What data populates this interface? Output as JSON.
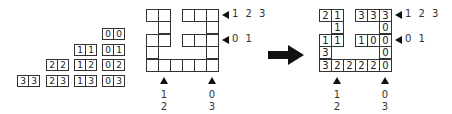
{
  "staircase": {
    "rows": [
      {
        "y": 28,
        "pairs": [
          {
            "x": 102,
            "a": "0",
            "b": "0"
          }
        ]
      },
      {
        "y": 44,
        "pairs": [
          {
            "x": 74,
            "a": "1",
            "b": "1"
          },
          {
            "x": 102,
            "a": "0",
            "b": "1"
          }
        ]
      },
      {
        "y": 59,
        "pairs": [
          {
            "x": 46,
            "a": "2",
            "b": "2"
          },
          {
            "x": 74,
            "a": "1",
            "b": "2"
          },
          {
            "x": 102,
            "a": "0",
            "b": "2"
          }
        ]
      },
      {
        "y": 75,
        "pairs": [
          {
            "x": 17,
            "a": "3",
            "b": "3"
          },
          {
            "x": 46,
            "a": "2",
            "b": "3"
          },
          {
            "x": 74,
            "a": "1",
            "b": "3"
          },
          {
            "x": 102,
            "a": "0",
            "b": "3"
          }
        ]
      }
    ]
  },
  "grid_empty": {
    "origin_x": 146,
    "origin_y": 9,
    "cell_w": 12,
    "cell_h": 12.4,
    "cells": [
      [
        0,
        0,
        ""
      ],
      [
        0,
        1,
        ""
      ],
      [
        0,
        3,
        ""
      ],
      [
        0,
        4,
        ""
      ],
      [
        0,
        5,
        ""
      ],
      [
        1,
        1,
        ""
      ],
      [
        1,
        5,
        ""
      ],
      [
        2,
        0,
        ""
      ],
      [
        2,
        1,
        ""
      ],
      [
        2,
        3,
        ""
      ],
      [
        2,
        4,
        ""
      ],
      [
        2,
        5,
        ""
      ],
      [
        3,
        0,
        ""
      ],
      [
        3,
        5,
        ""
      ],
      [
        4,
        0,
        ""
      ],
      [
        4,
        1,
        ""
      ],
      [
        4,
        2,
        ""
      ],
      [
        4,
        3,
        ""
      ],
      [
        4,
        4,
        ""
      ],
      [
        4,
        5,
        ""
      ]
    ],
    "row_markers": [
      {
        "row": 0,
        "label": "1 2 3"
      },
      {
        "row": 2,
        "label": "0 1"
      }
    ],
    "col_markers": [
      {
        "col": 1,
        "line1": "1",
        "line2": "2"
      },
      {
        "col": 5,
        "line1": "0",
        "line2": "3"
      }
    ]
  },
  "arrow": {
    "symbol": "right-arrow",
    "color": "#111111"
  },
  "grid_filled": {
    "origin_x": 319,
    "origin_y": 9,
    "cell_w": 12,
    "cell_h": 12.4,
    "cells": [
      [
        0,
        0,
        "2"
      ],
      [
        0,
        1,
        "1"
      ],
      [
        0,
        3,
        "3"
      ],
      [
        0,
        4,
        "3"
      ],
      [
        0,
        5,
        "3"
      ],
      [
        1,
        1,
        "1"
      ],
      [
        1,
        5,
        "0"
      ],
      [
        2,
        0,
        "1"
      ],
      [
        2,
        1,
        "1"
      ],
      [
        2,
        3,
        "1"
      ],
      [
        2,
        4,
        "0"
      ],
      [
        2,
        5,
        "0"
      ],
      [
        3,
        0,
        "3"
      ],
      [
        3,
        5,
        "0"
      ],
      [
        4,
        0,
        "3"
      ],
      [
        4,
        1,
        "2"
      ],
      [
        4,
        2,
        "2"
      ],
      [
        4,
        3,
        "2"
      ],
      [
        4,
        4,
        "2"
      ],
      [
        4,
        5,
        "0"
      ]
    ],
    "row_markers": [
      {
        "row": 0,
        "label": "1 2 3"
      },
      {
        "row": 2,
        "label": "0 1"
      }
    ],
    "col_markers": [
      {
        "col": 1,
        "line1": "1",
        "line2": "2"
      },
      {
        "col": 5,
        "line1": "0",
        "line2": "3"
      }
    ]
  }
}
